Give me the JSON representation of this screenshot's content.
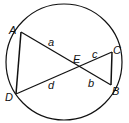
{
  "diagram": {
    "type": "intersecting-chords-in-circle",
    "circle": {
      "cx": 64,
      "cy": 62,
      "r": 58
    },
    "points": {
      "A": {
        "x": 21,
        "y": 32,
        "label": "A"
      },
      "B": {
        "x": 111,
        "y": 85,
        "label": "B"
      },
      "C": {
        "x": 112,
        "y": 52,
        "label": "C"
      },
      "D": {
        "x": 16,
        "y": 94,
        "label": "D"
      },
      "E": {
        "x": 79,
        "y": 67,
        "label": "E"
      }
    },
    "segment_labels": {
      "a": "a",
      "b": "b",
      "c": "c",
      "d": "d"
    },
    "stroke_color": "#111111"
  }
}
